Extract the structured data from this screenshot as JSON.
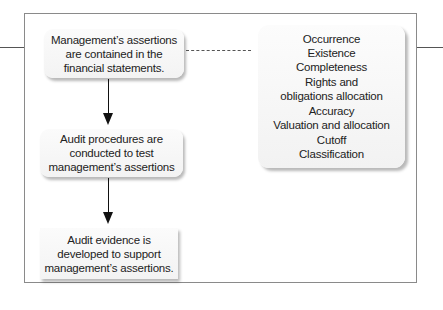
{
  "diagram": {
    "boxes": [
      {
        "id": "assertions",
        "lines": [
          "Management’s assertions",
          "are contained in the",
          "financial statements."
        ]
      },
      {
        "id": "procedures",
        "lines": [
          "Audit procedures are",
          "conducted to test",
          "management’s assertions"
        ]
      },
      {
        "id": "evidence",
        "lines": [
          "Audit evidence is",
          "developed to support",
          "management’s assertions."
        ]
      }
    ],
    "assertion_list": [
      "Occurrence",
      "Existence",
      "Completeness",
      "Rights and",
      "obligations allocation",
      "Accuracy",
      "Valuation and allocation",
      "Cutoff",
      "Classification"
    ],
    "connections": [
      {
        "from": "assertions",
        "to": "procedures",
        "style": "arrow"
      },
      {
        "from": "procedures",
        "to": "evidence",
        "style": "arrow"
      },
      {
        "from": "assertions",
        "to": "assertion_list",
        "style": "dashed"
      }
    ]
  }
}
